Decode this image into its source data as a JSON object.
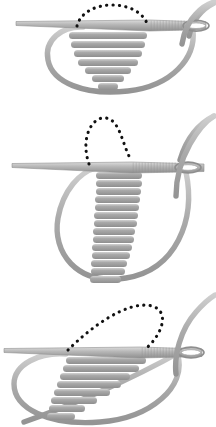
{
  "document": {
    "title": "Satin Stitch Embroidery Sequence",
    "type": "instructional-diagram",
    "background_color": "#ffffff",
    "panel_count": 3
  },
  "palette": {
    "background": "#ffffff",
    "thread_gray": "#a9a9a9",
    "thread_gray_shadow": "#9a9a9a",
    "thread_highlight": "#cfcfcf",
    "stitch_fill": "#a5a5a5",
    "stitch_highlight": "#d2d2d2",
    "stitch_shadow": "#8f8f8f",
    "needle_body": "#b4b4b4",
    "needle_highlight": "#dcdcdc",
    "needle_edge": "#8c8c8c",
    "dotted_line": "#111111"
  },
  "panels": [
    {
      "id": "panel-1",
      "step_number": "1",
      "caption": "",
      "stitch_shape": "symmetric-tapered-wedge",
      "stitch_bar_count": 7,
      "dotted_path": "arch-over-top",
      "needle": {
        "orientation": "horizontal",
        "point_direction": "left",
        "eye_position": "right",
        "shaft_texture": "hatched"
      },
      "thread_loop": "large-oval-below",
      "bars": [
        {
          "x": 69,
          "y": 32,
          "w": 78,
          "h": 7
        },
        {
          "x": 71,
          "y": 41,
          "w": 74,
          "h": 7
        },
        {
          "x": 74,
          "y": 50,
          "w": 68,
          "h": 7
        },
        {
          "x": 78,
          "y": 59,
          "w": 60,
          "h": 7
        },
        {
          "x": 85,
          "y": 67,
          "w": 46,
          "h": 7
        },
        {
          "x": 92,
          "y": 75,
          "w": 32,
          "h": 7
        },
        {
          "x": 98,
          "y": 83,
          "w": 20,
          "h": 7
        }
      ]
    },
    {
      "id": "panel-2",
      "step_number": "2",
      "caption": "",
      "stitch_shape": "long-tapered-column",
      "stitch_bar_count": 18,
      "dotted_path": "narrow-loop-above-left",
      "needle": {
        "orientation": "horizontal",
        "point_direction": "left",
        "eye_position": "right",
        "shaft_texture": "hatched"
      },
      "thread_loop": "large-oval-below",
      "bars": [
        {
          "x": 96,
          "y": 62,
          "w": 46,
          "h": 7
        },
        {
          "x": 96,
          "y": 70,
          "w": 46,
          "h": 7
        },
        {
          "x": 96,
          "y": 78,
          "w": 45,
          "h": 7
        },
        {
          "x": 95,
          "y": 86,
          "w": 45,
          "h": 7
        },
        {
          "x": 95,
          "y": 94,
          "w": 44,
          "h": 7
        },
        {
          "x": 94,
          "y": 102,
          "w": 44,
          "h": 7
        },
        {
          "x": 94,
          "y": 110,
          "w": 43,
          "h": 7
        },
        {
          "x": 93,
          "y": 118,
          "w": 42,
          "h": 7
        },
        {
          "x": 93,
          "y": 126,
          "w": 41,
          "h": 7
        },
        {
          "x": 92,
          "y": 134,
          "w": 40,
          "h": 7
        },
        {
          "x": 92,
          "y": 142,
          "w": 38,
          "h": 7
        },
        {
          "x": 91,
          "y": 150,
          "w": 36,
          "h": 7
        },
        {
          "x": 91,
          "y": 158,
          "w": 34,
          "h": 7
        },
        {
          "x": 90,
          "y": 166,
          "w": 31,
          "h": 7
        },
        {
          "x": 90,
          "y": 174,
          "w": 28,
          "h": 7
        },
        {
          "x": 89,
          "y": 182,
          "w": 24,
          "h": 7
        },
        {
          "x": 89,
          "y": 190,
          "w": 19,
          "h": 7
        },
        {
          "x": 88,
          "y": 198,
          "w": 14,
          "h": 7
        }
      ]
    },
    {
      "id": "panel-3",
      "step_number": "3",
      "caption": "",
      "stitch_shape": "diagonal-staggered-fan",
      "stitch_bar_count": 8,
      "dotted_path": "wide-arch-upper-right",
      "needle": {
        "orientation": "horizontal",
        "point_direction": "left",
        "eye_position": "right",
        "shaft_texture": "hatched"
      },
      "thread_loop": "large-tilted-oval-below",
      "bars": [
        {
          "x": 66,
          "y": 67,
          "w": 80,
          "h": 7
        },
        {
          "x": 63,
          "y": 75,
          "w": 76,
          "h": 7
        },
        {
          "x": 60,
          "y": 83,
          "w": 70,
          "h": 7
        },
        {
          "x": 57,
          "y": 91,
          "w": 64,
          "h": 7
        },
        {
          "x": 54,
          "y": 99,
          "w": 56,
          "h": 7
        },
        {
          "x": 51,
          "y": 107,
          "w": 46,
          "h": 7
        },
        {
          "x": 49,
          "y": 115,
          "w": 36,
          "h": 7
        },
        {
          "x": 47,
          "y": 123,
          "w": 28,
          "h": 7
        }
      ]
    }
  ]
}
